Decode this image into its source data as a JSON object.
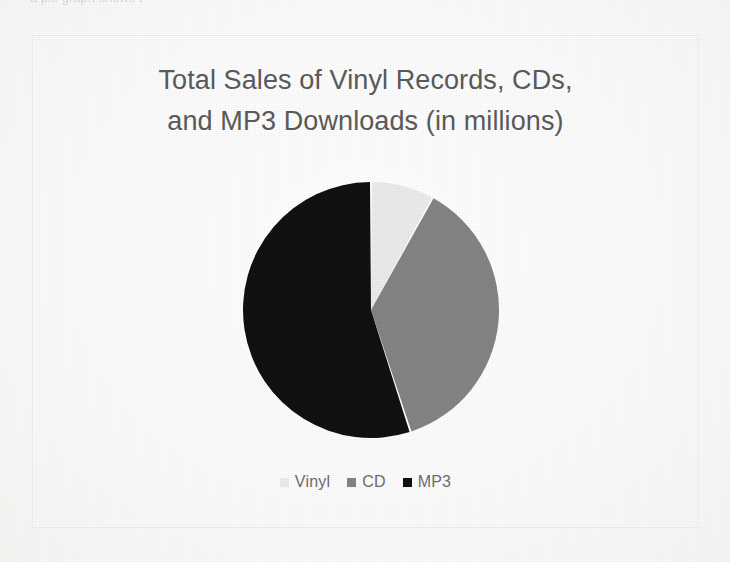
{
  "page": {
    "background_color": "#fdfdfd",
    "clipped_top_line": "a pie graph shows t"
  },
  "chart_frame": {
    "border_color": "#f0f0f0"
  },
  "legend": {
    "items": [
      {
        "label": "Vinyl",
        "color": "#ececec",
        "swatch_name": "legend-swatch-vinyl"
      },
      {
        "label": "CD",
        "color": "#848484",
        "swatch_name": "legend-swatch-cd"
      },
      {
        "label": "MP3",
        "color": "#111111",
        "swatch_name": "legend-swatch-mp3"
      }
    ]
  },
  "chart_data": {
    "type": "pie",
    "title": "Total Sales of Vinyl Records, CDs,\nand MP3 Downloads (in millions)",
    "title_color": "#5b5b5b",
    "xlabel": "",
    "ylabel": "",
    "categories": [
      "Vinyl",
      "CD",
      "MP3"
    ],
    "values": [
      8,
      37,
      55
    ],
    "value_unit": "percent of total",
    "colors": [
      "#ececec",
      "#848484",
      "#111111"
    ],
    "legend_position": "bottom",
    "grid": false,
    "start_angle_deg": 0,
    "direction": "clockwise",
    "slice_gap_color": "#ffffff",
    "data_labels_shown": false
  }
}
